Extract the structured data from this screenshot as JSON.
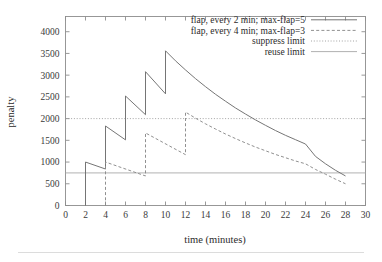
{
  "chart_data": {
    "type": "line",
    "title": "",
    "xlabel": "time (minutes)",
    "ylabel": "penalty",
    "xlim": [
      0,
      30
    ],
    "ylim": [
      0,
      4350
    ],
    "grid": false,
    "legend_position": "top-right",
    "xticks": [
      0,
      2,
      4,
      6,
      8,
      10,
      12,
      14,
      16,
      18,
      20,
      22,
      24,
      26,
      28,
      30
    ],
    "xtick_labels": [
      "0",
      "2",
      "4",
      "6",
      "8",
      "10",
      "12",
      "14",
      "16",
      "18",
      "20",
      "22",
      "24",
      "26",
      "28",
      "30"
    ],
    "yticks": [
      0,
      500,
      1000,
      1500,
      2000,
      2500,
      3000,
      3500,
      4000
    ],
    "ytick_labels": [
      "0",
      "500",
      "1000",
      "1500",
      "2000",
      "2500",
      "3000",
      "3500",
      "4000"
    ],
    "series": [
      {
        "name": "flap, every 2 min; max-flap=5",
        "style": "solid",
        "color": "#6e6e6e",
        "flap_interval_min": 2,
        "max_flap": 5,
        "flap_times": [
          2,
          4,
          6,
          8,
          10
        ],
        "peak_values": [
          1000,
          1830,
          2520,
          3080,
          3560
        ],
        "trough_values": [
          840,
          1510,
          2090,
          2570
        ],
        "decay_end_time": 28,
        "decay_end_value": 680,
        "points": [
          [
            2,
            0
          ],
          [
            2,
            1000
          ],
          [
            4,
            840
          ],
          [
            4,
            1830
          ],
          [
            6,
            1510
          ],
          [
            6,
            2520
          ],
          [
            8,
            2090
          ],
          [
            8,
            3080
          ],
          [
            10,
            2570
          ],
          [
            10,
            3560
          ],
          [
            11,
            3330
          ],
          [
            12,
            3120
          ],
          [
            13,
            2920
          ],
          [
            14,
            2735
          ],
          [
            15,
            2560
          ],
          [
            16,
            2400
          ],
          [
            17,
            2245
          ],
          [
            18,
            2105
          ],
          [
            19,
            1970
          ],
          [
            20,
            1845
          ],
          [
            21,
            1725
          ],
          [
            22,
            1615
          ],
          [
            23,
            1515
          ],
          [
            24,
            1415
          ],
          [
            25,
            1130
          ],
          [
            26,
            960
          ],
          [
            27,
            810
          ],
          [
            28,
            680
          ]
        ]
      },
      {
        "name": "flap, every 4 min; max-flap=3",
        "style": "dashed",
        "color": "#8a8a8a",
        "flap_interval_min": 4,
        "max_flap": 3,
        "flap_times": [
          4,
          8,
          12
        ],
        "peak_values": [
          1000,
          1670,
          2150
        ],
        "trough_values": [
          680,
          1170
        ],
        "decay_end_time": 28,
        "decay_end_value": 500,
        "points": [
          [
            4,
            0
          ],
          [
            4,
            1000
          ],
          [
            8,
            680
          ],
          [
            8,
            1670
          ],
          [
            12,
            1170
          ],
          [
            12,
            2150
          ],
          [
            13,
            2010
          ],
          [
            14,
            1880
          ],
          [
            15,
            1760
          ],
          [
            16,
            1645
          ],
          [
            17,
            1540
          ],
          [
            18,
            1440
          ],
          [
            19,
            1345
          ],
          [
            20,
            1260
          ],
          [
            21,
            1175
          ],
          [
            22,
            1100
          ],
          [
            23,
            1025
          ],
          [
            24,
            960
          ],
          [
            25,
            830
          ],
          [
            26,
            720
          ],
          [
            27,
            605
          ],
          [
            28,
            500
          ]
        ]
      }
    ],
    "reference_lines": [
      {
        "name": "suppress limit",
        "style": "dotted",
        "color": "#9a9a9a",
        "orientation": "horizontal",
        "value": 2000
      },
      {
        "name": "reuse limit",
        "style": "solid",
        "color": "#a8a8a8",
        "orientation": "horizontal",
        "value": 750
      }
    ],
    "legend": [
      {
        "label": "flap, every 2 min; max-flap=5",
        "style": "solid"
      },
      {
        "label": "flap, every 4 min; max-flap=3",
        "style": "dashed"
      },
      {
        "label": "suppress limit",
        "style": "dotted"
      },
      {
        "label": "reuse limit",
        "style": "solid"
      }
    ]
  }
}
